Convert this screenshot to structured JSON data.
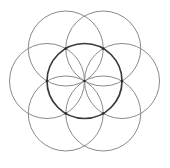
{
  "diagram": {
    "name": "Seed of Life",
    "center": {
      "x": 84.5,
      "y": 81
    },
    "radius": 37.5,
    "central_circle": {
      "stroke": "#3a3a3a",
      "stroke_width": 1.7
    },
    "petal_circles": {
      "count": 6,
      "start_angle_deg": 0,
      "stroke": "#8a8a8a",
      "stroke_width": 1.0
    },
    "nodes": {
      "radius": 1.3,
      "fill": "#2a2a2a",
      "include_center": true
    },
    "background": "#ffffff"
  }
}
